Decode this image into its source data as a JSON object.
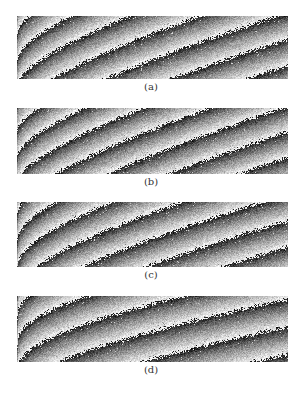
{
  "figure": {
    "panels": [
      {
        "id": "a",
        "label": "(a)",
        "top": 16,
        "height": 63,
        "label_top": 81,
        "fringe": {
          "cycles_vertical": 2.4,
          "curve_gain": 2.1,
          "curve_shape": 0.55,
          "offset": 0.35,
          "seed": 11
        }
      },
      {
        "id": "b",
        "label": "(b)",
        "top": 108,
        "height": 66,
        "label_top": 176,
        "fringe": {
          "cycles_vertical": 2.6,
          "curve_gain": 2.0,
          "curve_shape": 0.6,
          "offset": 0.15,
          "seed": 23
        }
      },
      {
        "id": "c",
        "label": "(c)",
        "top": 202,
        "height": 65,
        "label_top": 269,
        "fringe": {
          "cycles_vertical": 2.5,
          "curve_gain": 2.0,
          "curve_shape": 0.5,
          "offset": 0.55,
          "seed": 37
        }
      },
      {
        "id": "d",
        "label": "(d)",
        "top": 296,
        "height": 66,
        "label_top": 364,
        "fringe": {
          "cycles_vertical": 2.4,
          "curve_gain": 1.6,
          "curve_shape": 0.4,
          "offset": 0.25,
          "seed": 53
        }
      }
    ]
  },
  "colors": {
    "background": "#ffffff",
    "dark": "#111111",
    "light": "#f2f2f2",
    "caption": "#333333"
  }
}
